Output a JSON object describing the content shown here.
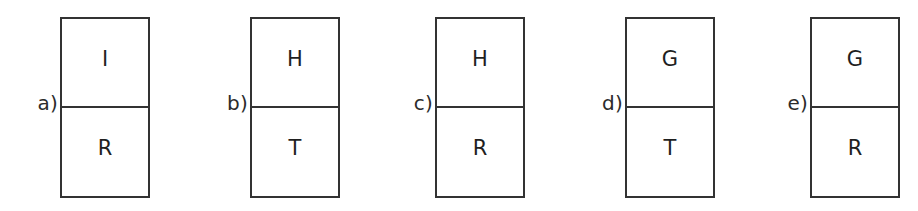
{
  "figure": {
    "background_color": "#ffffff",
    "line_color": "#333333",
    "text_color": "#1f1f1f",
    "options": [
      {
        "label": "a)",
        "top_letter": "I",
        "bottom_letter": "R"
      },
      {
        "label": "b)",
        "top_letter": "H",
        "bottom_letter": "T"
      },
      {
        "label": "c)",
        "top_letter": "H",
        "bottom_letter": "R"
      },
      {
        "label": "d)",
        "top_letter": "G",
        "bottom_letter": "T"
      },
      {
        "label": "e)",
        "top_letter": "G",
        "bottom_letter": "R"
      }
    ]
  }
}
